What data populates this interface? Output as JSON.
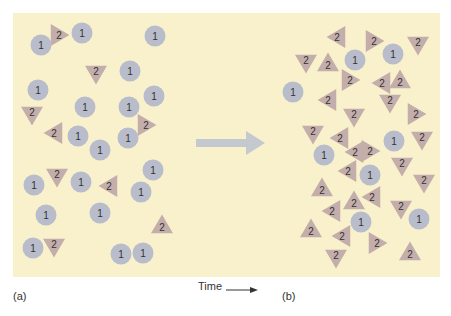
{
  "figure": {
    "panel_a_label": "(a)",
    "panel_b_label": "(b)",
    "time_label": "Time",
    "colors": {
      "background": "#f9f1cb",
      "circle": "#b9bdcb",
      "triangle": "#c3aeab",
      "arrow": "#c4c9cf",
      "text": "#333333"
    },
    "legend": {
      "circle_species": "1",
      "triangle_species": "2"
    }
  },
  "panel_a": {
    "circles": [
      [
        41,
        45
      ],
      [
        82,
        33
      ],
      [
        155,
        36
      ],
      [
        130,
        71
      ],
      [
        38,
        90
      ],
      [
        154,
        96
      ],
      [
        85,
        107
      ],
      [
        129,
        107
      ],
      [
        78,
        136
      ],
      [
        128,
        138
      ],
      [
        100,
        150
      ],
      [
        153,
        170
      ],
      [
        34,
        185
      ],
      [
        81,
        182
      ],
      [
        141,
        192
      ],
      [
        46,
        215
      ],
      [
        100,
        213
      ],
      [
        33,
        248
      ],
      [
        121,
        254
      ],
      [
        143,
        253
      ]
    ],
    "triangles": [
      [
        59,
        35,
        "right"
      ],
      [
        96,
        74,
        "down"
      ],
      [
        32,
        115,
        "down"
      ],
      [
        146,
        125,
        "right"
      ],
      [
        54,
        133,
        "left"
      ],
      [
        57,
        177,
        "down"
      ],
      [
        109,
        186,
        "left"
      ],
      [
        162,
        225,
        "up"
      ],
      [
        54,
        247,
        "down"
      ]
    ]
  },
  "panel_b": {
    "circles": [
      [
        355,
        60
      ],
      [
        393,
        54
      ],
      [
        293,
        92
      ],
      [
        394,
        141
      ],
      [
        324,
        155
      ],
      [
        370,
        175
      ],
      [
        361,
        222
      ],
      [
        419,
        219
      ]
    ],
    "triangles": [
      [
        337,
        37,
        "left"
      ],
      [
        374,
        41,
        "right"
      ],
      [
        418,
        45,
        "down"
      ],
      [
        306,
        63,
        "down"
      ],
      [
        328,
        63,
        "up"
      ],
      [
        350,
        80,
        "right"
      ],
      [
        382,
        83,
        "left"
      ],
      [
        400,
        80,
        "up"
      ],
      [
        328,
        100,
        "left"
      ],
      [
        390,
        103,
        "down"
      ],
      [
        354,
        117,
        "down"
      ],
      [
        416,
        114,
        "right"
      ],
      [
        313,
        134,
        "down"
      ],
      [
        340,
        138,
        "left"
      ],
      [
        422,
        140,
        "down"
      ],
      [
        355,
        152,
        "left"
      ],
      [
        370,
        151,
        "right"
      ],
      [
        348,
        171,
        "left"
      ],
      [
        402,
        166,
        "down"
      ],
      [
        322,
        188,
        "up"
      ],
      [
        424,
        183,
        "down"
      ],
      [
        354,
        201,
        "up"
      ],
      [
        372,
        197,
        "left"
      ],
      [
        332,
        211,
        "left"
      ],
      [
        401,
        209,
        "down"
      ],
      [
        311,
        229,
        "up"
      ],
      [
        342,
        236,
        "left"
      ],
      [
        377,
        243,
        "right"
      ],
      [
        410,
        252,
        "up"
      ],
      [
        336,
        258,
        "down"
      ]
    ]
  }
}
